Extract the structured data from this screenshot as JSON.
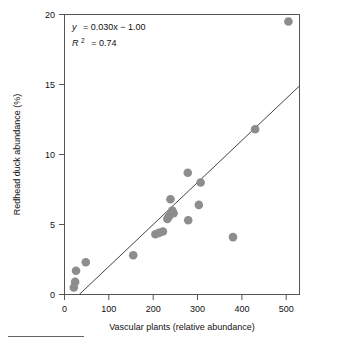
{
  "chart_data": {
    "type": "scatter",
    "title": "",
    "xlabel": "Vascular plants (relative abundance)",
    "ylabel": "Redhead duck abundance (%)",
    "xlim": [
      0,
      530
    ],
    "ylim": [
      0,
      20
    ],
    "xticks": [
      0,
      100,
      200,
      300,
      400,
      500
    ],
    "xtick_labels": [
      "0",
      "100",
      "200",
      "300",
      "400",
      "500"
    ],
    "yticks": [
      0,
      5,
      10,
      15,
      20
    ],
    "ytick_labels": [
      "0",
      "5",
      "10",
      "15",
      "20"
    ],
    "grid": false,
    "legend": null,
    "marker_color": "#8d8d8d",
    "line_color": "#444444",
    "points": [
      {
        "x": 21,
        "y": 0.5
      },
      {
        "x": 24,
        "y": 0.9
      },
      {
        "x": 26,
        "y": 1.7
      },
      {
        "x": 48,
        "y": 2.3
      },
      {
        "x": 155,
        "y": 2.8
      },
      {
        "x": 205,
        "y": 4.3
      },
      {
        "x": 213,
        "y": 4.4
      },
      {
        "x": 222,
        "y": 4.5
      },
      {
        "x": 232,
        "y": 5.4
      },
      {
        "x": 236,
        "y": 5.6
      },
      {
        "x": 241,
        "y": 5.8
      },
      {
        "x": 246,
        "y": 5.8
      },
      {
        "x": 239,
        "y": 6.8
      },
      {
        "x": 243,
        "y": 6.0
      },
      {
        "x": 278,
        "y": 8.7
      },
      {
        "x": 279,
        "y": 5.3
      },
      {
        "x": 303,
        "y": 6.4
      },
      {
        "x": 307,
        "y": 8.0
      },
      {
        "x": 380,
        "y": 4.1
      },
      {
        "x": 430,
        "y": 11.8
      },
      {
        "x": 505,
        "y": 19.5
      }
    ],
    "fit_line": {
      "slope": 0.03,
      "intercept": -1.0,
      "x_start": 33,
      "x_end": 530
    },
    "annotations": {
      "equation_y": "y",
      "equation_body": "= 0.030x − 1.00",
      "r_symbol": "R",
      "r_exponent": "2",
      "r_value": "= 0.74"
    }
  }
}
